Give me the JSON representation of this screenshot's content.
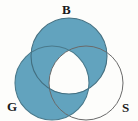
{
  "figure": {
    "name": "three-set-venn-diagram",
    "type": "venn",
    "width": 138,
    "height": 121,
    "background_color": "#fdfdfb"
  },
  "chart_data": {
    "type": "venn",
    "title": "",
    "subtitle": "",
    "xlabel": "",
    "ylabel": "",
    "grid": false,
    "legend_position": "none",
    "sets": [
      {
        "id": "B",
        "label": "B",
        "label_position": "top",
        "cx": 69,
        "cy": 56,
        "r": 38,
        "filled": true,
        "fill_color": "#62a3be",
        "stroke_color": "#3f6f82"
      },
      {
        "id": "G",
        "label": "G",
        "label_position": "bottom-left",
        "cx": 52,
        "cy": 83,
        "r": 37,
        "filled": true,
        "fill_color": "#62a3be",
        "stroke_color": "#3f6f82"
      },
      {
        "id": "S",
        "label": "S",
        "label_position": "bottom-right",
        "cx": 86,
        "cy": 83,
        "r": 37,
        "filled": false,
        "fill_color": "#ffffff",
        "stroke_color": "#6a6a6a"
      }
    ],
    "regions": [
      {
        "id": "B-only",
        "sets": [
          "B"
        ],
        "shaded": true
      },
      {
        "id": "G-only",
        "sets": [
          "G"
        ],
        "shaded": true
      },
      {
        "id": "S-only",
        "sets": [
          "S"
        ],
        "shaded": false
      },
      {
        "id": "B-and-G",
        "sets": [
          "B",
          "G"
        ],
        "shaded": true
      },
      {
        "id": "B-and-S",
        "sets": [
          "B",
          "S"
        ],
        "shaded": true
      },
      {
        "id": "G-and-S",
        "sets": [
          "G",
          "S"
        ],
        "shaded": true
      },
      {
        "id": "B-G-and-S",
        "sets": [
          "B",
          "G",
          "S"
        ],
        "shaded": false
      }
    ],
    "shaded_expression": "(B union G) minus (B intersect G intersect S)",
    "shade_color": "#62a3be",
    "unshaded_color": "#ffffff"
  },
  "labels": {
    "b": "B",
    "g": "G",
    "s": "S"
  }
}
